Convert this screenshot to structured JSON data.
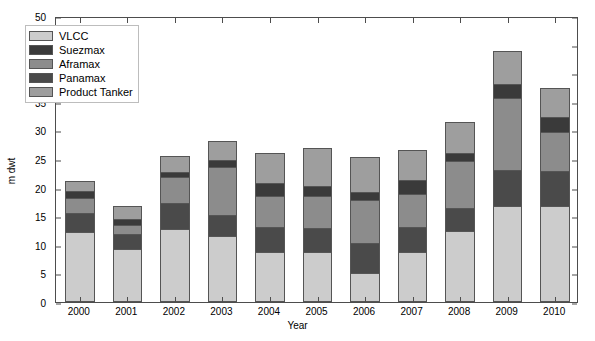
{
  "chart_data": {
    "type": "bar",
    "subtype": "stacked-bar",
    "title": "",
    "xlabel": "Year",
    "ylabel": "m dwt",
    "categories": [
      "2000",
      "2001",
      "2002",
      "2003",
      "2004",
      "2005",
      "2006",
      "2007",
      "2008",
      "2009",
      "2010"
    ],
    "ylim": [
      0,
      50
    ],
    "yticks": [
      0,
      5,
      10,
      15,
      20,
      25,
      30,
      35,
      40,
      45,
      50
    ],
    "grid": false,
    "legend_position": "upper-left",
    "stack_order_bottom_to_top": [
      "VLCC",
      "Panamax",
      "Aframax",
      "Suezmax",
      "Product Tanker"
    ],
    "series": [
      {
        "name": "VLCC",
        "color": "#cccccc",
        "values": [
          12.2,
          9.2,
          12.7,
          11.5,
          8.8,
          8.8,
          5.1,
          8.8,
          12.5,
          16.7,
          16.8
        ]
      },
      {
        "name": "Panamax",
        "color": "#4a4a4a",
        "values": [
          3.3,
          2.7,
          4.6,
          3.7,
          4.3,
          4.2,
          5.2,
          4.3,
          4.0,
          6.4,
          6.1
        ]
      },
      {
        "name": "Aframax",
        "color": "#8c8c8c",
        "values": [
          2.7,
          1.6,
          4.6,
          8.4,
          5.4,
          5.5,
          7.6,
          5.7,
          8.2,
          12.6,
          6.9
        ]
      },
      {
        "name": "Suezmax",
        "color": "#3a3a3a",
        "values": [
          1.2,
          1.0,
          0.9,
          1.2,
          2.3,
          1.8,
          1.4,
          2.6,
          1.3,
          2.5,
          2.5
        ]
      },
      {
        "name": "Product Tanker",
        "color": "#9e9e9e",
        "values": [
          1.8,
          2.2,
          2.7,
          3.4,
          5.3,
          6.6,
          6.1,
          5.2,
          5.5,
          5.7,
          5.1
        ]
      }
    ],
    "totals": [
      21.2,
      16.7,
      25.5,
      28.2,
      26.1,
      26.9,
      25.4,
      26.6,
      31.5,
      43.9,
      37.4
    ]
  },
  "axes": {
    "ytick_labels": [
      "0",
      "5",
      "10",
      "15",
      "20",
      "25",
      "30",
      "35",
      "40",
      "45",
      "50"
    ],
    "xtick_labels": [
      "2000",
      "2001",
      "2002",
      "2003",
      "2004",
      "2005",
      "2006",
      "2007",
      "2008",
      "2009",
      "2010"
    ],
    "y_title": "m dwt",
    "x_title": "Year"
  },
  "legend": {
    "items": [
      {
        "label": "VLCC",
        "color": "#cccccc",
        "icon": "legend-swatch-vlcc"
      },
      {
        "label": "Suezmax",
        "color": "#3a3a3a",
        "icon": "legend-swatch-suezmax"
      },
      {
        "label": "Aframax",
        "color": "#8c8c8c",
        "icon": "legend-swatch-aframax"
      },
      {
        "label": "Panamax",
        "color": "#4a4a4a",
        "icon": "legend-swatch-panamax"
      },
      {
        "label": "Product Tanker",
        "color": "#9e9e9e",
        "icon": "legend-swatch-product-tanker"
      }
    ]
  }
}
